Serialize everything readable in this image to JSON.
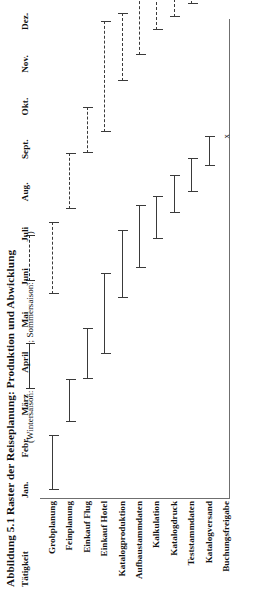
{
  "figure": {
    "title": "Abbildung 5.1 Raster der Reiseplanung: Produktion und Abwicklung",
    "legend_prefix": "(Wintersaison:",
    "legend_middle": "; Sommersaison:",
    "legend_suffix": ")",
    "row_header": "Tätigkeit",
    "marker_x": "x"
  },
  "chart_data": {
    "type": "bar",
    "title": "Abbildung 5.1 Raster der Reiseplanung: Produktion und Abwicklung",
    "xlabel": "",
    "ylabel": "Tätigkeit",
    "grid": false,
    "legend_position": "top",
    "categories": [
      "Jan.",
      "Febr.",
      "März",
      "April",
      "Mai",
      "Juni",
      "Juli",
      "Aug.",
      "Sept.",
      "Okt.",
      "Nov.",
      "Dez."
    ],
    "series": [
      {
        "name": "Wintersaison",
        "style": "solid"
      },
      {
        "name": "Sommersaison",
        "style": "dashed"
      }
    ],
    "rows": [
      {
        "label": "Grobplanung",
        "bars": [
          {
            "season": "Wintersaison",
            "start": 1.0,
            "end": 2.3
          },
          {
            "season": "Sommersaison",
            "start": 5.6,
            "end": 7.3
          }
        ]
      },
      {
        "label": "Feinplanung",
        "bars": [
          {
            "season": "Wintersaison",
            "start": 2.6,
            "end": 3.6
          },
          {
            "season": "Sommersaison",
            "start": 7.6,
            "end": 8.9
          }
        ]
      },
      {
        "label": "Einkauf Flug",
        "bars": [
          {
            "season": "Wintersaison",
            "start": 3.6,
            "end": 4.8
          },
          {
            "season": "Sommersaison",
            "start": 8.9,
            "end": 10.0
          }
        ]
      },
      {
        "label": "Einkauf Hotel",
        "bars": [
          {
            "season": "Wintersaison",
            "start": 4.2,
            "end": 6.1
          },
          {
            "season": "Sommersaison",
            "start": 9.4,
            "end": 12.0
          }
        ]
      },
      {
        "label": "Katalogproduktion",
        "bars": [
          {
            "season": "Wintersaison",
            "start": 5.5,
            "end": 7.1
          },
          {
            "season": "Sommersaison",
            "start": 10.6,
            "end": 12.2
          }
        ]
      },
      {
        "label": "Aufbaustammdaten",
        "bars": [
          {
            "season": "Wintersaison",
            "start": 6.2,
            "end": 7.7
          },
          {
            "season": "Sommersaison",
            "start": 11.2,
            "end": 12.6
          }
        ]
      },
      {
        "label": "Kalkulation",
        "bars": [
          {
            "season": "Wintersaison",
            "start": 6.9,
            "end": 7.9
          },
          {
            "season": "Sommersaison",
            "start": 11.8,
            "end": 12.8
          }
        ]
      },
      {
        "label": "Katalogdruck",
        "bars": [
          {
            "season": "Wintersaison",
            "start": 7.5,
            "end": 8.4
          },
          {
            "season": "Sommersaison",
            "start": 12.1,
            "end": 13.0
          }
        ]
      },
      {
        "label": "Teststammdaten",
        "bars": [
          {
            "season": "Wintersaison",
            "start": 8.0,
            "end": 8.8
          },
          {
            "season": "Sommersaison",
            "start": 12.4,
            "end": 13.1
          }
        ]
      },
      {
        "label": "Katalogversand",
        "bars": [
          {
            "season": "Wintersaison",
            "start": 8.6,
            "end": 9.3
          },
          {
            "season": "Sommersaison",
            "start": 12.7,
            "end": 13.4
          }
        ]
      },
      {
        "label": "Buchungsfreigabe",
        "bars": [
          {
            "season": "Wintersaison",
            "start": 9.3,
            "end": 9.3,
            "marker": "x"
          },
          {
            "season": "Sommersaison",
            "start": 13.6,
            "end": 13.6,
            "marker": "x"
          }
        ]
      }
    ]
  }
}
